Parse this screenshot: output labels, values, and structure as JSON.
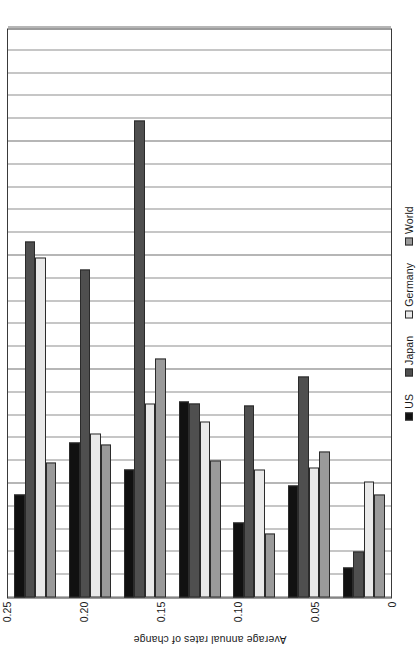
{
  "chart_data": {
    "type": "bar",
    "orientation": "vertical-rotated",
    "title": "",
    "xlabel": "",
    "ylabel": "Average annual rates of change",
    "ylim": [
      0,
      0.25
    ],
    "grid": true,
    "grid_minor_step": 0.01,
    "legend_position": "bottom",
    "categories": [
      "1950–58",
      "1958–65",
      "1965–71",
      "1971–78",
      "1978–85",
      "1985–97",
      "1998–99"
    ],
    "tick_labels": [
      "0.25",
      "0.20",
      "0.15",
      "0.10",
      "0.05",
      "0"
    ],
    "tick_values": [
      0.25,
      0.2,
      0.15,
      0.1,
      0.05,
      0
    ],
    "series": [
      {
        "name": "US",
        "color": "#111111",
        "values": [
          0.045,
          0.068,
          0.056,
          0.086,
          0.033,
          0.049,
          0.013
        ]
      },
      {
        "name": "Japan",
        "color": "#4f4f4f",
        "values": [
          0.156,
          0.144,
          0.209,
          0.085,
          0.084,
          0.097,
          0.02
        ]
      },
      {
        "name": "Germany",
        "color": "#e9e9e9",
        "values": [
          0.149,
          0.072,
          0.085,
          0.077,
          0.056,
          0.057,
          0.051
        ]
      },
      {
        "name": "World",
        "color": "#9a9a9a",
        "values": [
          0.059,
          0.067,
          0.105,
          0.06,
          0.028,
          0.064,
          0.045
        ]
      }
    ]
  }
}
